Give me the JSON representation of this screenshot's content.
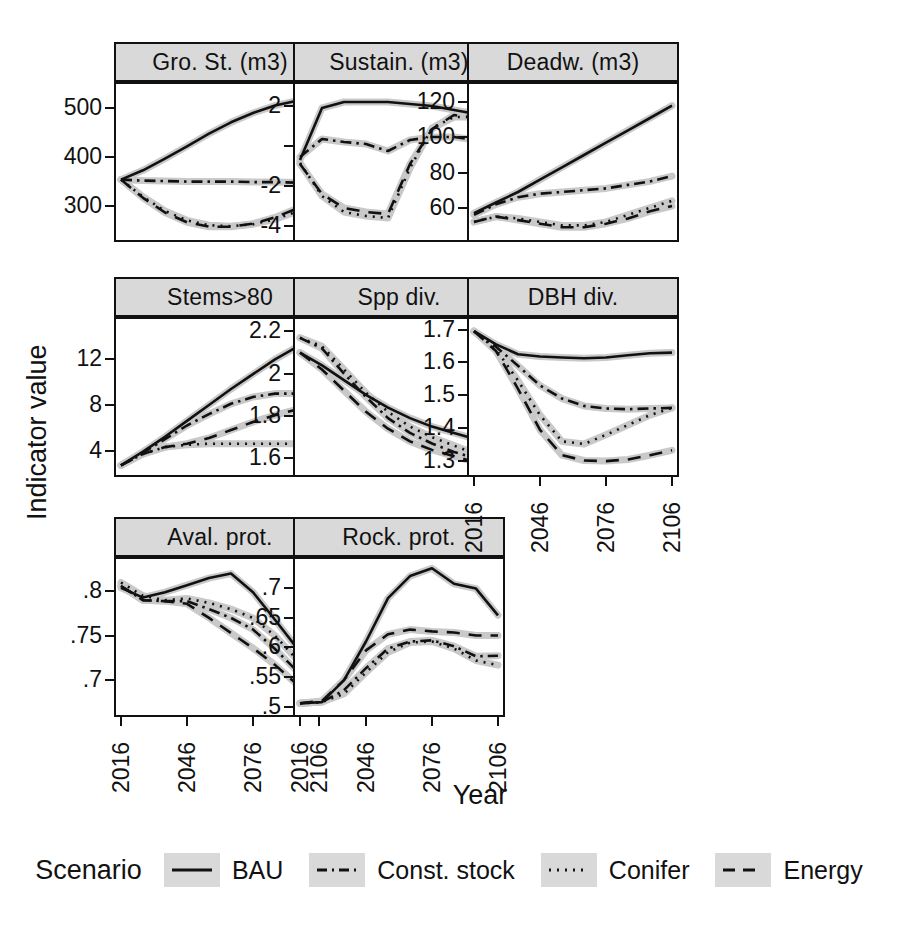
{
  "figure": {
    "axis_y_title": "Indicator value",
    "axis_x_title": "Year",
    "band_color": "#c9c9c9",
    "line_color": "#111111",
    "strip_color": "#d9d9d9"
  },
  "legend": {
    "title": "Scenario",
    "items": [
      {
        "label": "BAU",
        "style": "solid",
        "dash": "none"
      },
      {
        "label": "Const. stock",
        "style": "dash-dot",
        "dash": "10,5,2,5"
      },
      {
        "label": "Conifer",
        "style": "dotted",
        "dash": "2,6"
      },
      {
        "label": "Energy",
        "style": "dashed",
        "dash": "12,8"
      }
    ]
  },
  "chart_data": {
    "type": "line",
    "title": "",
    "xlabel": "Year",
    "ylabel": "Indicator value",
    "grid": false,
    "legend_position": "bottom",
    "x": [
      2016,
      2026,
      2036,
      2046,
      2056,
      2066,
      2076,
      2086,
      2096,
      2106
    ],
    "xticks": [
      2016,
      2046,
      2076,
      2106
    ],
    "xlim": [
      2016,
      2106
    ],
    "series_names": [
      "BAU",
      "Const. stock",
      "Conifer",
      "Energy"
    ],
    "panels": [
      {
        "name": "Gro. St. (m3)",
        "yticks": [
          300,
          400,
          500
        ],
        "ylim": [
          238,
          540
        ],
        "series": [
          {
            "name": "BAU",
            "values": [
              353,
              372,
              396,
              421,
              447,
              470,
              489,
              504,
              514,
              520
            ]
          },
          {
            "name": "Const. stock",
            "values": [
              353,
              351,
              350,
              349,
              349,
              349,
              348,
              348,
              347,
              347
            ]
          },
          {
            "name": "Conifer",
            "values": [
              353,
              318,
              289,
              270,
              260,
              258,
              262,
              272,
              288,
              305
            ]
          },
          {
            "name": "Energy",
            "values": [
              353,
              316,
              286,
              266,
              257,
              257,
              263,
              276,
              294,
              313
            ]
          }
        ]
      },
      {
        "name": "Sustain. (m3)",
        "yticks": [
          -4,
          -2,
          0,
          2
        ],
        "ylim": [
          -4.5,
          2.9
        ],
        "series": [
          {
            "name": "BAU",
            "values": [
              -0.7,
              1.9,
              2.2,
              2.2,
              2.2,
              2.1,
              2.0,
              1.8,
              1.6,
              1.35
            ]
          },
          {
            "name": "Const. stock",
            "values": [
              -0.55,
              0.35,
              0.2,
              0.1,
              -0.25,
              0.3,
              0.45,
              0.45,
              0.3,
              0.45
            ]
          },
          {
            "name": "Conifer",
            "values": [
              -0.85,
              -2.5,
              -3.3,
              -3.5,
              -3.6,
              -1.1,
              0.9,
              1.45,
              1.45,
              1.35
            ]
          },
          {
            "name": "Energy",
            "values": [
              -0.9,
              -2.4,
              -3.1,
              -3.3,
              -3.4,
              -0.9,
              0.85,
              1.55,
              1.4,
              1.25
            ]
          }
        ]
      },
      {
        "name": "Deadw. (m3)",
        "yticks": [
          60,
          80,
          100,
          120
        ],
        "ylim": [
          44,
          128
        ],
        "series": [
          {
            "name": "BAU",
            "values": [
              57,
              63,
              69,
              76,
              83,
              90,
              97,
              104,
              111,
              118
            ]
          },
          {
            "name": "Const. stock",
            "values": [
              56,
              62,
              66,
              68,
              69,
              70,
              71,
              73,
              75,
              78
            ]
          },
          {
            "name": "Conifer",
            "values": [
              52,
              55,
              54,
              52,
              50,
              50,
              52,
              56,
              60,
              64
            ]
          },
          {
            "name": "Energy",
            "values": [
              52,
              55,
              53,
              51,
              49,
              49,
              51,
              54,
              58,
              61
            ]
          }
        ]
      },
      {
        "name": "Stems>80",
        "yticks": [
          4,
          8,
          12
        ],
        "ylim": [
          2.2,
          15.2
        ],
        "series": [
          {
            "name": "BAU",
            "values": [
              2.7,
              3.9,
              5.2,
              6.6,
              8.0,
              9.4,
              10.7,
              12.0,
              13.1,
              14.0
            ]
          },
          {
            "name": "Const. stock",
            "values": [
              2.7,
              3.8,
              5.0,
              6.2,
              7.2,
              8.1,
              8.7,
              9.0,
              9.0,
              8.8
            ]
          },
          {
            "name": "Conifer",
            "values": [
              2.7,
              3.7,
              4.3,
              4.5,
              4.6,
              4.6,
              4.6,
              4.6,
              4.6,
              4.6
            ]
          },
          {
            "name": "Energy",
            "values": [
              2.7,
              3.7,
              4.3,
              4.6,
              5.1,
              5.8,
              6.5,
              7.1,
              7.6,
              8.0
            ]
          }
        ]
      },
      {
        "name": "Spp div.",
        "yticks": [
          1.6,
          1.8,
          2.0,
          2.2
        ],
        "ylim": [
          1.54,
          2.24
        ],
        "series": [
          {
            "name": "BAU",
            "values": [
              2.1,
              2.04,
              1.97,
              1.9,
              1.84,
              1.79,
              1.75,
              1.72,
              1.69,
              1.66
            ]
          },
          {
            "name": "Const. stock",
            "values": [
              2.17,
              2.12,
              2.0,
              1.89,
              1.79,
              1.72,
              1.67,
              1.63,
              1.6,
              1.57
            ]
          },
          {
            "name": "Conifer",
            "values": [
              2.17,
              2.13,
              2.02,
              1.91,
              1.82,
              1.75,
              1.7,
              1.66,
              1.62,
              1.58
            ]
          },
          {
            "name": "Energy",
            "values": [
              2.1,
              2.02,
              1.92,
              1.82,
              1.74,
              1.68,
              1.64,
              1.61,
              1.58,
              1.56
            ]
          }
        ]
      },
      {
        "name": "DBH div.",
        "yticks": [
          1.3,
          1.4,
          1.5,
          1.6,
          1.7
        ],
        "ylim": [
          1.27,
          1.72
        ],
        "series": [
          {
            "name": "BAU",
            "values": [
              1.695,
              1.655,
              1.625,
              1.618,
              1.615,
              1.613,
              1.615,
              1.622,
              1.628,
              1.63
            ]
          },
          {
            "name": "Const. stock",
            "values": [
              1.695,
              1.648,
              1.59,
              1.53,
              1.49,
              1.468,
              1.46,
              1.458,
              1.46,
              1.462
            ]
          },
          {
            "name": "Conifer",
            "values": [
              1.695,
              1.64,
              1.545,
              1.44,
              1.36,
              1.352,
              1.38,
              1.41,
              1.44,
              1.462
            ]
          },
          {
            "name": "Energy",
            "values": [
              1.695,
              1.635,
              1.52,
              1.395,
              1.318,
              1.302,
              1.3,
              1.305,
              1.318,
              1.333
            ]
          }
        ]
      },
      {
        "name": "Aval. prot.",
        "yticks": [
          0.7,
          0.75,
          0.8
        ],
        "ylim": [
          0.665,
          0.832
        ],
        "series": [
          {
            "name": "BAU",
            "values": [
              0.804,
              0.793,
              0.799,
              0.807,
              0.815,
              0.82,
              0.799,
              0.768,
              0.736,
              0.706
            ]
          },
          {
            "name": "Const. stock",
            "values": [
              0.806,
              0.79,
              0.789,
              0.789,
              0.78,
              0.77,
              0.757,
              0.735,
              0.71,
              0.678
            ]
          },
          {
            "name": "Conifer",
            "values": [
              0.81,
              0.795,
              0.79,
              0.792,
              0.787,
              0.78,
              0.77,
              0.75,
              0.723,
              0.694
            ]
          },
          {
            "name": "Energy",
            "values": [
              0.806,
              0.79,
              0.789,
              0.786,
              0.77,
              0.753,
              0.736,
              0.717,
              0.695,
              0.672
            ]
          }
        ]
      },
      {
        "name": "Rock. prot.",
        "yticks": [
          0.5,
          0.55,
          0.6,
          0.65,
          0.7
        ],
        "ylim": [
          0.493,
          0.742
        ],
        "series": [
          {
            "name": "BAU",
            "values": [
              0.506,
              0.508,
              0.545,
              0.61,
              0.683,
              0.72,
              0.733,
              0.707,
              0.699,
              0.654
            ]
          },
          {
            "name": "Const. stock",
            "values": [
              0.506,
              0.508,
              0.528,
              0.565,
              0.598,
              0.61,
              0.612,
              0.602,
              0.585,
              0.586
            ]
          },
          {
            "name": "Conifer",
            "values": [
              0.506,
              0.508,
              0.522,
              0.558,
              0.592,
              0.608,
              0.61,
              0.598,
              0.578,
              0.57
            ]
          },
          {
            "name": "Energy",
            "values": [
              0.506,
              0.51,
              0.545,
              0.595,
              0.622,
              0.63,
              0.627,
              0.625,
              0.62,
              0.62
            ]
          }
        ]
      }
    ]
  }
}
